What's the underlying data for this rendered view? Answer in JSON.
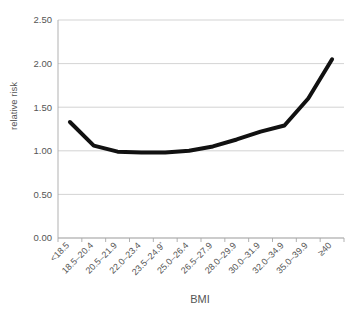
{
  "chart_data": {
    "type": "line",
    "title": "",
    "subtitle": "",
    "xlabel": "BMI",
    "ylabel": "relative risk",
    "categories": [
      "<18.5",
      "18.5–20.4",
      "20.5–21.9",
      "22.0–23.4",
      "23.5–24.9",
      "25.0–26.4",
      "26.5–27.9",
      "28.0–29.9",
      "30.0–31.9",
      "32.0–34.9",
      "35.0–39.9",
      "≥40"
    ],
    "category_annotations": {
      "4": "*"
    },
    "values": [
      1.33,
      1.06,
      0.99,
      0.98,
      0.98,
      1.0,
      1.05,
      1.13,
      1.22,
      1.29,
      1.6,
      2.05
    ],
    "series": [
      {
        "name": "relative risk",
        "values": [
          1.33,
          1.06,
          0.99,
          0.98,
          0.98,
          1.0,
          1.05,
          1.13,
          1.22,
          1.29,
          1.6,
          2.05
        ],
        "color": "#111111"
      }
    ],
    "ylim": [
      0.0,
      2.5
    ],
    "ytick_values": [
      0.0,
      0.5,
      1.0,
      1.5,
      2.0,
      2.5
    ],
    "ytick_labels": [
      "0.00",
      "0.50",
      "1.00",
      "1.50",
      "2.00",
      "2.50"
    ],
    "grid": true,
    "grid_axis": "y",
    "legend": false,
    "legend_position": "none",
    "markers": false,
    "xtick_rotation_degrees": 45,
    "colors": {
      "line": "#111111",
      "grid": "#c8c8c8",
      "axis": "#a8a8a8",
      "text": "#555555",
      "background": "#ffffff"
    }
  }
}
